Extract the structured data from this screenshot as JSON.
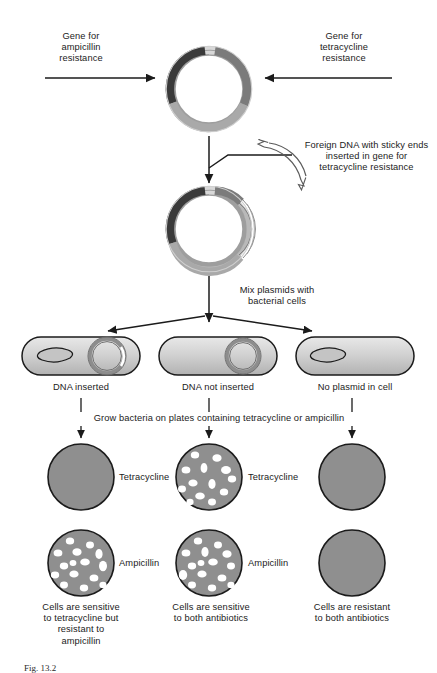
{
  "figure": {
    "title_caption": "Fig. 13.2",
    "background_color": "#ffffff",
    "ink_color": "#1b1b1b"
  },
  "colors": {
    "plasmid_backbone": "#9a9a9a",
    "plasmid_backbone_light": "#c3c3c3",
    "amp_gene_dark": "#3d3d3d",
    "tet_gene_mid": "#7d7d7d",
    "insert_white": "#ffffff",
    "cell_fill": "#c9c9c9",
    "cell_fill_light": "#e2e2e2",
    "plate_fill": "#8f8f8f",
    "colony_white": "#ffffff",
    "outline": "#1b1b1b"
  },
  "top_section": {
    "left_label": "Gene for\nampicillin\nresistance",
    "right_label": "Gene for\ntetracycline\nresistance",
    "left_arrow_name": "arrow-to-ampicillin-gene",
    "right_arrow_name": "arrow-to-tetracycline-gene",
    "plasmid_name": "plasmid-original"
  },
  "insert_section": {
    "foreign_dna_label": "Foreign DNA with sticky ends\ninserted in gene for\ntetracycline resistance",
    "plasmid_name": "plasmid-recombinant"
  },
  "mix_section": {
    "mix_label": "Mix plasmids with\nbacterial cells"
  },
  "cells": [
    {
      "id": "cell-dna-inserted",
      "label": "DNA inserted",
      "has_plasmid": true,
      "has_insert": true,
      "has_chromosome": true
    },
    {
      "id": "cell-dna-not-inserted",
      "label": "DNA not inserted",
      "has_plasmid": true,
      "has_insert": false,
      "has_chromosome": false
    },
    {
      "id": "cell-no-plasmid",
      "label": "No plasmid in cell",
      "has_plasmid": false,
      "has_insert": false,
      "has_chromosome": true
    }
  ],
  "grow_section": {
    "grow_label": "Grow bacteria on plates containing tetracycline or ampicillin"
  },
  "plates": {
    "tetracycline_row_labels": [
      "Tetracycline",
      "Tetracycline"
    ],
    "ampicillin_row_labels": [
      "Ampicillin",
      "Ampicillin"
    ],
    "tetracycline": [
      {
        "id": "plate-tet-col1",
        "colonies": 0
      },
      {
        "id": "plate-tet-col2",
        "colonies": 13
      },
      {
        "id": "plate-tet-col3",
        "colonies": 0
      }
    ],
    "ampicillin": [
      {
        "id": "plate-amp-col1",
        "colonies": 15
      },
      {
        "id": "plate-amp-col2",
        "colonies": 15
      },
      {
        "id": "plate-amp-col3",
        "colonies": 0
      }
    ]
  },
  "conclusions": [
    "Cells are sensitive\nto tetracycline but\nresistant to\nampicillin",
    "Cells are sensitive\nto both antibiotics",
    "Cells are resistant\nto both antibiotics"
  ]
}
